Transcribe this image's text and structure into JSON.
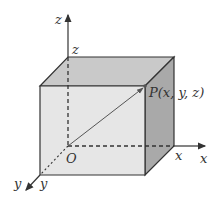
{
  "diagram": {
    "labels": {
      "z_axis": "z",
      "z_edge": "z",
      "x_axis": "x",
      "x_edge": "x",
      "y_axis": "y",
      "y_edge": "y",
      "origin": "O",
      "point": "P(x, y, z)"
    },
    "colors": {
      "front_face": "#e6e6e6",
      "top_face": "#c9c9c9",
      "side_face": "#a9a9a9",
      "edge": "#333333",
      "vector": "#555555"
    }
  }
}
